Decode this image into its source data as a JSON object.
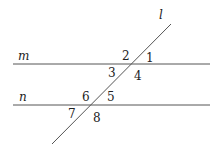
{
  "diagram": {
    "lines": {
      "m": {
        "label": "m",
        "x1": 13,
        "y1": 64,
        "x2": 210,
        "y2": 64
      },
      "n": {
        "label": "n",
        "x1": 13,
        "y1": 105,
        "x2": 210,
        "y2": 105
      },
      "l": {
        "label": "l",
        "x1": 171,
        "y1": 24,
        "x2": 52,
        "y2": 144
      }
    },
    "angles": [
      "1",
      "2",
      "3",
      "4",
      "5",
      "6",
      "7",
      "8"
    ],
    "color": "#555555"
  }
}
